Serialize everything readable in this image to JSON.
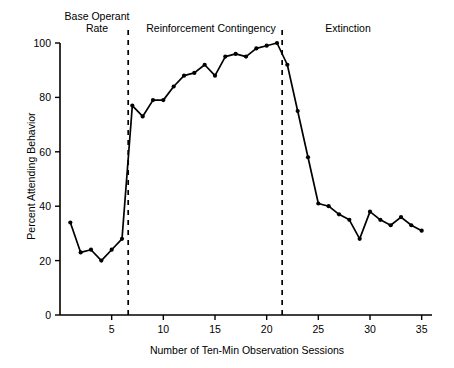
{
  "chart_data": {
    "type": "line",
    "title": "",
    "xlabel": "Number of Ten-Min Observation Sessions",
    "ylabel": "Percent Attending Behavior",
    "xlim": [
      0,
      36
    ],
    "ylim": [
      0,
      100
    ],
    "xticks": [
      5,
      10,
      15,
      20,
      25,
      30,
      35
    ],
    "yticks": [
      0,
      20,
      40,
      60,
      80,
      100
    ],
    "grid": false,
    "legend": null,
    "marker": "filled-circle",
    "line_color": "#000000",
    "x": [
      1,
      2,
      3,
      4,
      5,
      6,
      7,
      8,
      9,
      10,
      11,
      12,
      13,
      14,
      15,
      16,
      17,
      18,
      19,
      20,
      21,
      22,
      23,
      24,
      25,
      26,
      27,
      28,
      29,
      30,
      31,
      32,
      33,
      34,
      35
    ],
    "values": [
      34,
      23,
      24,
      20,
      24,
      28,
      77,
      73,
      79,
      79,
      84,
      88,
      89,
      92,
      88,
      95,
      96,
      95,
      98,
      99,
      100,
      92,
      75,
      58,
      41,
      40,
      37,
      35,
      28,
      38,
      35,
      33,
      36,
      33,
      31
    ],
    "series": [
      {
        "name": "Percent Attending Behavior",
        "values": [
          34,
          23,
          24,
          20,
          24,
          28,
          77,
          73,
          79,
          79,
          84,
          88,
          89,
          92,
          88,
          95,
          96,
          95,
          98,
          99,
          100,
          92,
          75,
          58,
          41,
          40,
          37,
          35,
          28,
          38,
          35,
          33,
          36,
          33,
          31
        ]
      }
    ],
    "phase_lines": [
      {
        "name": "base-to-reinforcement",
        "x": 6.6,
        "style": "dashed"
      },
      {
        "name": "reinforcement-to-extinction",
        "x": 21.5,
        "style": "dashed"
      }
    ],
    "annotations": [
      {
        "name": "base-operant-rate",
        "text": "Base Operant\nRate",
        "x_center": 3.4
      },
      {
        "name": "reinforcement-contingency",
        "text": "Reinforcement Contingency",
        "x_center": 14.0
      },
      {
        "name": "extinction",
        "text": "Extinction",
        "x_center": 29.5
      }
    ]
  },
  "axes": {
    "x_title": "Number of Ten-Min Observation Sessions",
    "y_title": "Percent Attending Behavior",
    "x_tick_labels": [
      "5",
      "10",
      "15",
      "20",
      "25",
      "30",
      "35"
    ],
    "y_tick_labels": [
      "0",
      "20",
      "40",
      "60",
      "80",
      "100"
    ]
  },
  "phases": {
    "base": "Base Operant\nRate",
    "reinforcement": "Reinforcement Contingency",
    "extinction": "Extinction"
  }
}
